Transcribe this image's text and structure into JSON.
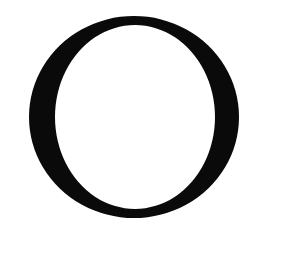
{
  "glyph": {
    "character": "O",
    "style": "serif",
    "fill_color": "#0a0a0a",
    "background_color": "#ffffff"
  }
}
